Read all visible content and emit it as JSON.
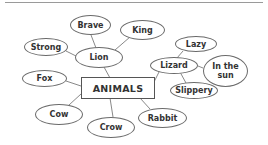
{
  "diagram": {
    "type": "mind-map",
    "center": {
      "label": "ANIMALS"
    },
    "nodes": [
      {
        "id": "lion",
        "label": "Lion",
        "parent": "animals"
      },
      {
        "id": "brave",
        "label": "Brave",
        "parent": "lion"
      },
      {
        "id": "king",
        "label": "King",
        "parent": "lion"
      },
      {
        "id": "strong",
        "label": "Strong",
        "parent": "lion"
      },
      {
        "id": "lizard",
        "label": "Lizard",
        "parent": "animals"
      },
      {
        "id": "lazy",
        "label": "Lazy",
        "parent": "lizard"
      },
      {
        "id": "in-the-sun",
        "label": "In the sun",
        "parent": "lizard"
      },
      {
        "id": "slippery",
        "label": "Slippery",
        "parent": "lizard"
      },
      {
        "id": "fox",
        "label": "Fox",
        "parent": "animals"
      },
      {
        "id": "cow",
        "label": "Cow",
        "parent": "animals"
      },
      {
        "id": "crow",
        "label": "Crow",
        "parent": "animals"
      },
      {
        "id": "rabbit",
        "label": "Rabbit",
        "parent": "animals"
      }
    ],
    "labels": {
      "center": "ANIMALS",
      "lion": "Lion",
      "brave": "Brave",
      "king": "King",
      "strong": "Strong",
      "lizard": "Lizard",
      "lazy": "Lazy",
      "in_the_sun_line1": "In the",
      "in_the_sun_line2": "sun",
      "slippery": "Slippery",
      "fox": "Fox",
      "cow": "Cow",
      "crow": "Crow",
      "rabbit": "Rabbit"
    },
    "colors": {
      "outline": "#6a6a6a",
      "connector": "#6a6a6a",
      "text": "#333333",
      "background": "#ffffff"
    }
  }
}
